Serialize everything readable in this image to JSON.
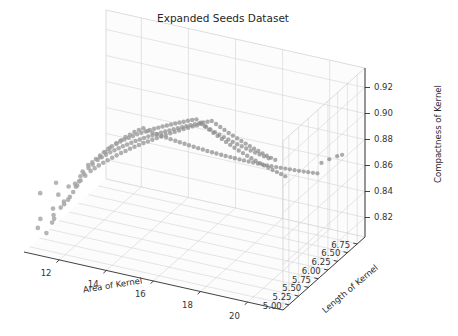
{
  "figure": {
    "title": "Expanded Seeds Dataset",
    "background_color": "#ffffff",
    "width": 458,
    "height": 336
  },
  "chart_data": {
    "type": "scatter",
    "projection": "3d",
    "title": "Expanded Seeds Dataset",
    "xlabel": "Area of Kernel",
    "ylabel": "Length of Kernel",
    "zlabel": "Compactness of Kernel",
    "xticks": [
      12,
      14,
      16,
      18,
      20
    ],
    "yticks": [
      5.0,
      5.25,
      5.5,
      5.75,
      6.0,
      6.25,
      6.5,
      6.75
    ],
    "zticks": [
      0.82,
      0.84,
      0.86,
      0.88,
      0.9,
      0.92
    ],
    "xticklabels": [
      "12",
      "14",
      "16",
      "18",
      "20"
    ],
    "yticklabels": [
      "5.00",
      "5.25",
      "5.50",
      "5.75",
      "6.00",
      "6.25",
      "6.50",
      "6.75"
    ],
    "zticklabels": [
      "0.82",
      "0.84",
      "0.86",
      "0.88",
      "0.90",
      "0.92"
    ],
    "xlim": [
      10.5,
      21.5
    ],
    "ylim": [
      4.85,
      6.95
    ],
    "zlim": [
      0.805,
      0.935
    ],
    "grid": true,
    "legend": null,
    "marker": {
      "shape": "circle",
      "size": 4.2,
      "color": "#777777",
      "alpha": 0.75
    },
    "elev": 18,
    "azim": -62,
    "n_points": 210,
    "points": [
      [
        10.59,
        5.21,
        0.841
      ],
      [
        11.02,
        5.28,
        0.829
      ],
      [
        10.74,
        5.06,
        0.8189
      ],
      [
        11.23,
        5.23,
        0.8511
      ],
      [
        11.41,
        5.18,
        0.844
      ],
      [
        10.83,
        5.07,
        0.8259
      ],
      [
        11.55,
        5.24,
        0.8376
      ],
      [
        11.18,
        5.16,
        0.8221
      ],
      [
        12.05,
        5.36,
        0.8559
      ],
      [
        11.65,
        5.3,
        0.848
      ],
      [
        11.34,
        5.1,
        0.8301
      ],
      [
        12.3,
        5.41,
        0.8642
      ],
      [
        11.87,
        5.33,
        0.8502
      ],
      [
        11.02,
        5.11,
        0.8147
      ],
      [
        12.11,
        5.38,
        0.8593
      ],
      [
        11.48,
        5.2,
        0.8338
      ],
      [
        12.72,
        5.46,
        0.8707
      ],
      [
        12.01,
        5.35,
        0.8521
      ],
      [
        11.75,
        5.27,
        0.8412
      ],
      [
        11.3,
        5.14,
        0.826
      ],
      [
        12.88,
        5.5,
        0.8741
      ],
      [
        12.44,
        5.43,
        0.8663
      ],
      [
        11.94,
        5.31,
        0.8487
      ],
      [
        11.59,
        5.22,
        0.8363
      ],
      [
        13.02,
        5.53,
        0.8772
      ],
      [
        12.56,
        5.45,
        0.8689
      ],
      [
        12.18,
        5.37,
        0.8581
      ],
      [
        11.71,
        5.25,
        0.8395
      ],
      [
        13.22,
        5.58,
        0.8801
      ],
      [
        12.69,
        5.48,
        0.8712
      ],
      [
        12.33,
        5.4,
        0.8624
      ],
      [
        11.86,
        5.29,
        0.8449
      ],
      [
        13.37,
        5.61,
        0.8823
      ],
      [
        12.8,
        5.51,
        0.8734
      ],
      [
        12.47,
        5.42,
        0.8651
      ],
      [
        11.98,
        5.32,
        0.8496
      ],
      [
        13.5,
        5.64,
        0.8845
      ],
      [
        12.93,
        5.54,
        0.8756
      ],
      [
        12.6,
        5.47,
        0.8678
      ],
      [
        12.09,
        5.34,
        0.8533
      ],
      [
        13.64,
        5.67,
        0.886
      ],
      [
        13.06,
        5.56,
        0.8777
      ],
      [
        12.74,
        5.49,
        0.8698
      ],
      [
        12.21,
        5.39,
        0.8562
      ],
      [
        13.78,
        5.7,
        0.8878
      ],
      [
        13.19,
        5.59,
        0.8793
      ],
      [
        12.87,
        5.52,
        0.8716
      ],
      [
        12.35,
        5.44,
        0.859
      ],
      [
        13.92,
        5.73,
        0.8891
      ],
      [
        13.31,
        5.62,
        0.8809
      ],
      [
        13.0,
        5.55,
        0.8731
      ],
      [
        12.49,
        5.46,
        0.8612
      ],
      [
        14.06,
        5.76,
        0.8903
      ],
      [
        13.44,
        5.65,
        0.882
      ],
      [
        13.13,
        5.58,
        0.8744
      ],
      [
        12.63,
        5.48,
        0.8634
      ],
      [
        14.2,
        5.79,
        0.888
      ],
      [
        13.57,
        5.68,
        0.8831
      ],
      [
        13.26,
        5.61,
        0.8757
      ],
      [
        12.77,
        5.51,
        0.8652
      ],
      [
        14.35,
        5.82,
        0.8865
      ],
      [
        13.7,
        5.71,
        0.8842
      ],
      [
        13.39,
        5.64,
        0.8769
      ],
      [
        12.91,
        5.54,
        0.8669
      ],
      [
        14.49,
        5.85,
        0.885
      ],
      [
        13.83,
        5.74,
        0.8852
      ],
      [
        13.52,
        5.67,
        0.878
      ],
      [
        13.05,
        5.57,
        0.8686
      ],
      [
        14.63,
        5.88,
        0.8835
      ],
      [
        13.96,
        5.77,
        0.8861
      ],
      [
        13.65,
        5.7,
        0.8791
      ],
      [
        13.19,
        5.6,
        0.8702
      ],
      [
        14.78,
        5.91,
        0.882
      ],
      [
        14.09,
        5.8,
        0.8869
      ],
      [
        13.78,
        5.73,
        0.8801
      ],
      [
        13.33,
        5.63,
        0.8717
      ],
      [
        14.92,
        5.94,
        0.8806
      ],
      [
        14.22,
        5.83,
        0.8877
      ],
      [
        13.91,
        5.76,
        0.881
      ],
      [
        13.47,
        5.66,
        0.8731
      ],
      [
        15.07,
        5.97,
        0.8792
      ],
      [
        14.35,
        5.86,
        0.8884
      ],
      [
        14.04,
        5.79,
        0.8819
      ],
      [
        13.61,
        5.69,
        0.8745
      ],
      [
        15.21,
        6.0,
        0.8778
      ],
      [
        14.48,
        5.89,
        0.889
      ],
      [
        14.17,
        5.82,
        0.8827
      ],
      [
        13.75,
        5.72,
        0.8758
      ],
      [
        15.36,
        6.03,
        0.8764
      ],
      [
        14.61,
        5.92,
        0.8896
      ],
      [
        14.3,
        5.85,
        0.8835
      ],
      [
        13.89,
        5.75,
        0.877
      ],
      [
        15.5,
        6.06,
        0.875
      ],
      [
        14.74,
        5.95,
        0.8901
      ],
      [
        14.43,
        5.88,
        0.8842
      ],
      [
        14.03,
        5.78,
        0.8782
      ],
      [
        15.65,
        6.09,
        0.8737
      ],
      [
        14.87,
        5.98,
        0.8906
      ],
      [
        14.56,
        5.91,
        0.8849
      ],
      [
        14.17,
        5.81,
        0.8793
      ],
      [
        15.79,
        6.12,
        0.8724
      ],
      [
        15.0,
        6.01,
        0.8911
      ],
      [
        14.69,
        5.94,
        0.8855
      ],
      [
        14.31,
        5.84,
        0.8804
      ],
      [
        15.94,
        6.15,
        0.8711
      ],
      [
        15.13,
        6.04,
        0.8915
      ],
      [
        14.82,
        5.97,
        0.8861
      ],
      [
        14.45,
        5.87,
        0.8814
      ],
      [
        16.08,
        6.18,
        0.8698
      ],
      [
        15.26,
        6.07,
        0.8919
      ],
      [
        14.95,
        6.0,
        0.8867
      ],
      [
        14.59,
        5.9,
        0.8824
      ],
      [
        16.23,
        6.21,
        0.8686
      ],
      [
        15.39,
        6.1,
        0.8923
      ],
      [
        15.08,
        6.03,
        0.8873
      ],
      [
        14.73,
        5.93,
        0.8834
      ],
      [
        16.37,
        6.24,
        0.8674
      ],
      [
        15.52,
        6.13,
        0.8926
      ],
      [
        15.21,
        6.06,
        0.8878
      ],
      [
        14.87,
        5.96,
        0.8843
      ],
      [
        16.52,
        6.27,
        0.8662
      ],
      [
        15.65,
        6.16,
        0.8929
      ],
      [
        15.34,
        6.09,
        0.8883
      ],
      [
        15.01,
        5.99,
        0.8852
      ],
      [
        16.66,
        6.3,
        0.8651
      ],
      [
        15.78,
        6.19,
        0.89
      ],
      [
        15.47,
        6.12,
        0.8888
      ],
      [
        15.15,
        6.02,
        0.8861
      ],
      [
        16.81,
        6.33,
        0.864
      ],
      [
        15.91,
        6.22,
        0.8871
      ],
      [
        15.6,
        6.15,
        0.8892
      ],
      [
        15.29,
        6.05,
        0.8869
      ],
      [
        16.95,
        6.36,
        0.8629
      ],
      [
        16.04,
        6.25,
        0.8843
      ],
      [
        15.73,
        6.18,
        0.8896
      ],
      [
        15.43,
        6.08,
        0.8877
      ],
      [
        17.1,
        6.39,
        0.8618
      ],
      [
        16.17,
        6.28,
        0.8815
      ],
      [
        15.86,
        6.21,
        0.89
      ],
      [
        15.57,
        6.11,
        0.8885
      ],
      [
        17.24,
        6.42,
        0.8608
      ],
      [
        16.3,
        6.31,
        0.8788
      ],
      [
        15.99,
        6.24,
        0.8903
      ],
      [
        15.71,
        6.14,
        0.8892
      ],
      [
        17.39,
        6.45,
        0.8598
      ],
      [
        16.43,
        6.34,
        0.8762
      ],
      [
        16.12,
        6.27,
        0.8906
      ],
      [
        15.85,
        6.17,
        0.8899
      ],
      [
        17.53,
        6.48,
        0.8588
      ],
      [
        16.56,
        6.37,
        0.8736
      ],
      [
        16.25,
        6.3,
        0.888
      ],
      [
        15.99,
        6.2,
        0.8875
      ],
      [
        17.68,
        6.51,
        0.8578
      ],
      [
        16.69,
        6.4,
        0.8711
      ],
      [
        16.38,
        6.33,
        0.8854
      ],
      [
        16.13,
        6.23,
        0.8852
      ],
      [
        17.82,
        6.54,
        0.8569
      ],
      [
        16.82,
        6.43,
        0.8686
      ],
      [
        16.51,
        6.36,
        0.8829
      ],
      [
        16.27,
        6.26,
        0.8829
      ],
      [
        17.97,
        6.57,
        0.856
      ],
      [
        16.95,
        6.46,
        0.8662
      ],
      [
        16.64,
        6.39,
        0.8804
      ],
      [
        16.41,
        6.29,
        0.8807
      ],
      [
        18.11,
        6.6,
        0.8551
      ],
      [
        17.08,
        6.49,
        0.8639
      ],
      [
        16.77,
        6.42,
        0.878
      ],
      [
        16.55,
        6.32,
        0.8786
      ],
      [
        18.26,
        6.63,
        0.8542
      ],
      [
        17.21,
        6.52,
        0.8616
      ],
      [
        16.9,
        6.45,
        0.8756
      ],
      [
        16.69,
        6.35,
        0.8765
      ],
      [
        18.4,
        6.66,
        0.8534
      ],
      [
        17.34,
        6.55,
        0.8594
      ],
      [
        17.03,
        6.48,
        0.8733
      ],
      [
        16.83,
        6.38,
        0.8745
      ],
      [
        18.55,
        6.69,
        0.8526
      ],
      [
        17.47,
        6.58,
        0.8572
      ],
      [
        17.16,
        6.51,
        0.871
      ],
      [
        16.97,
        6.41,
        0.8725
      ],
      [
        18.69,
        6.72,
        0.8518
      ],
      [
        17.6,
        6.61,
        0.8551
      ],
      [
        17.29,
        6.54,
        0.8688
      ],
      [
        17.11,
        6.44,
        0.8706
      ],
      [
        18.84,
        6.75,
        0.851
      ],
      [
        17.73,
        6.64,
        0.853
      ],
      [
        17.42,
        6.57,
        0.8666
      ],
      [
        17.25,
        6.47,
        0.8687
      ],
      [
        18.98,
        6.78,
        0.8502
      ],
      [
        17.86,
        6.67,
        0.851
      ],
      [
        17.55,
        6.6,
        0.8645
      ],
      [
        17.39,
        6.5,
        0.8669
      ],
      [
        19.13,
        6.81,
        0.8495
      ],
      [
        17.99,
        6.7,
        0.849
      ],
      [
        17.68,
        6.63,
        0.8624
      ],
      [
        17.53,
        6.53,
        0.8651
      ],
      [
        19.27,
        6.84,
        0.8488
      ],
      [
        18.12,
        6.73,
        0.8471
      ],
      [
        17.81,
        6.66,
        0.8604
      ],
      [
        17.67,
        6.56,
        0.8634
      ],
      [
        19.42,
        6.87,
        0.8481
      ],
      [
        18.25,
        6.76,
        0.8452
      ],
      [
        17.94,
        6.69,
        0.8584
      ],
      [
        17.81,
        6.59,
        0.8617
      ],
      [
        19.56,
        6.9,
        0.8474
      ],
      [
        18.38,
        6.79,
        0.8433
      ],
      [
        18.07,
        6.72,
        0.8565
      ],
      [
        17.95,
        6.62,
        0.86
      ],
      [
        20.1,
        6.88,
        0.861
      ],
      [
        20.71,
        6.84,
        0.868
      ],
      [
        19.9,
        6.8,
        0.8595
      ],
      [
        20.4,
        6.9,
        0.864
      ]
    ]
  },
  "axes": {
    "x": {
      "label": "Area of Kernel",
      "ticks": [
        "12",
        "14",
        "16",
        "18",
        "20"
      ]
    },
    "y": {
      "label": "Length of Kernel",
      "ticks": [
        "5.00",
        "5.25",
        "5.50",
        "5.75",
        "6.00",
        "6.25",
        "6.50",
        "6.75"
      ]
    },
    "z": {
      "label": "Compactness of Kernel",
      "ticks": [
        "0.82",
        "0.84",
        "0.86",
        "0.88",
        "0.90",
        "0.92"
      ]
    }
  },
  "style": {
    "grid_color": "#d3d3d3",
    "pane_color": "#fcfcfc",
    "axis_color": "#2b2b2b",
    "text_color": "#333333",
    "point_color": "#777777"
  }
}
